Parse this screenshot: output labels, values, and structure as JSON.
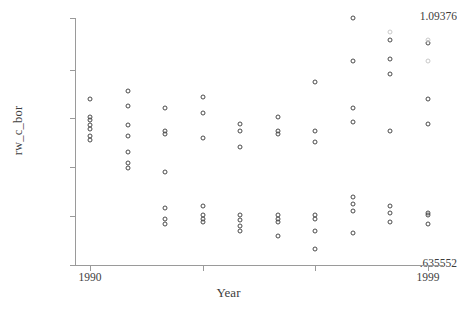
{
  "chart_data": {
    "type": "scatter",
    "title": "",
    "xlabel": "Year",
    "ylabel": "rw_c_bor",
    "grid": false,
    "legend": null,
    "xlim": [
      1989.6,
      1999.4
    ],
    "ylim": [
      0.635552,
      1.09376
    ],
    "xticks": [
      1990,
      1993,
      1996,
      1999
    ],
    "xtick_labels": [
      "1990",
      "",
      "",
      "1999"
    ],
    "yticks": [
      0.635552,
      0.726189,
      0.816826,
      0.907463,
      0.9981,
      1.09376
    ],
    "ytick_labels": [
      ".635552",
      "",
      "",
      "",
      "",
      "1.09376"
    ],
    "marker": "open-circle",
    "marker_color": "#4a4a4a",
    "series": [
      {
        "name": "rw_c_bor",
        "points": [
          {
            "x": 1990,
            "y": 0.9443
          },
          {
            "x": 1990,
            "y": 0.911
          },
          {
            "x": 1990,
            "y": 0.9044
          },
          {
            "x": 1990,
            "y": 0.8944
          },
          {
            "x": 1990,
            "y": 0.8878
          },
          {
            "x": 1990,
            "y": 0.8745
          },
          {
            "x": 1990,
            "y": 0.8679
          },
          {
            "x": 1991,
            "y": 0.9576
          },
          {
            "x": 1991,
            "y": 0.931
          },
          {
            "x": 1991,
            "y": 0.8944
          },
          {
            "x": 1991,
            "y": 0.8745
          },
          {
            "x": 1991,
            "y": 0.8446
          },
          {
            "x": 1991,
            "y": 0.8246
          },
          {
            "x": 1991,
            "y": 0.8147
          },
          {
            "x": 1992,
            "y": 0.9277
          },
          {
            "x": 1992,
            "y": 0.8845
          },
          {
            "x": 1992,
            "y": 0.8779
          },
          {
            "x": 1992,
            "y": 0.8081
          },
          {
            "x": 1992,
            "y": 0.7417
          },
          {
            "x": 1992,
            "y": 0.7217
          },
          {
            "x": 1992,
            "y": 0.7118
          },
          {
            "x": 1993,
            "y": 0.9476
          },
          {
            "x": 1993,
            "y": 0.9177
          },
          {
            "x": 1993,
            "y": 0.8712
          },
          {
            "x": 1993,
            "y": 0.745
          },
          {
            "x": 1993,
            "y": 0.7284
          },
          {
            "x": 1993,
            "y": 0.7217
          },
          {
            "x": 1993,
            "y": 0.7151
          },
          {
            "x": 1994,
            "y": 0.8978
          },
          {
            "x": 1994,
            "y": 0.8845
          },
          {
            "x": 1994,
            "y": 0.8546
          },
          {
            "x": 1994,
            "y": 0.7284
          },
          {
            "x": 1994,
            "y": 0.7184
          },
          {
            "x": 1994,
            "y": 0.7085
          },
          {
            "x": 1994,
            "y": 0.6985
          },
          {
            "x": 1995,
            "y": 0.911
          },
          {
            "x": 1995,
            "y": 0.8845
          },
          {
            "x": 1995,
            "y": 0.8778
          },
          {
            "x": 1995,
            "y": 0.7284
          },
          {
            "x": 1995,
            "y": 0.7217
          },
          {
            "x": 1995,
            "y": 0.7151
          },
          {
            "x": 1995,
            "y": 0.6886
          },
          {
            "x": 1996,
            "y": 0.9742
          },
          {
            "x": 1996,
            "y": 0.8845
          },
          {
            "x": 1996,
            "y": 0.8646
          },
          {
            "x": 1996,
            "y": 0.7284
          },
          {
            "x": 1996,
            "y": 0.7217
          },
          {
            "x": 1996,
            "y": 0.6985
          },
          {
            "x": 1996,
            "y": 0.6653
          },
          {
            "x": 1997,
            "y": 1.0937
          },
          {
            "x": 1997,
            "y": 1.0139
          },
          {
            "x": 1997,
            "y": 0.9277
          },
          {
            "x": 1997,
            "y": 0.9011
          },
          {
            "x": 1997,
            "y": 0.7616
          },
          {
            "x": 1997,
            "y": 0.7483
          },
          {
            "x": 1997,
            "y": 0.735
          },
          {
            "x": 1997,
            "y": 0.6952
          },
          {
            "x": 1998,
            "y": 1.0537
          },
          {
            "x": 1998,
            "y": 1.0172
          },
          {
            "x": 1998,
            "y": 0.9908
          },
          {
            "x": 1998,
            "y": 0.8845
          },
          {
            "x": 1998,
            "y": 0.745
          },
          {
            "x": 1998,
            "y": 0.7317
          },
          {
            "x": 1998,
            "y": 0.7151
          },
          {
            "x": 1999,
            "y": 1.0471
          },
          {
            "x": 1999,
            "y": 0.9443
          },
          {
            "x": 1999,
            "y": 0.8978
          },
          {
            "x": 1999,
            "y": 0.7317
          },
          {
            "x": 1999,
            "y": 0.7284
          },
          {
            "x": 1999,
            "y": 0.7118
          }
        ]
      },
      {
        "name": "faint-overprint",
        "faint": true,
        "points": [
          {
            "x": 1998,
            "y": 1.067
          },
          {
            "x": 1999,
            "y": 1.0537
          },
          {
            "x": 1999,
            "y": 1.0139
          }
        ]
      }
    ]
  },
  "axes": {
    "y_top_label": "1.09376",
    "y_bottom_label": ".635552",
    "y_title": "rw_c_bor",
    "x_left_label": "1990",
    "x_right_label": "1999",
    "x_title": "Year"
  }
}
